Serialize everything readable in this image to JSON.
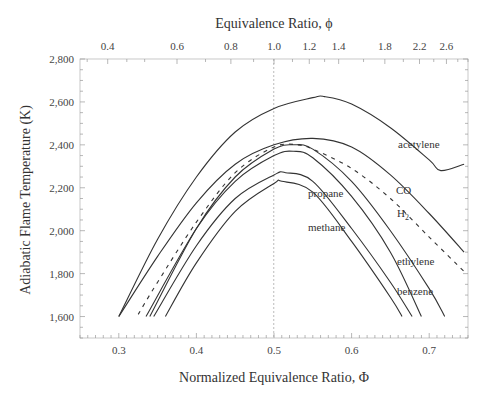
{
  "chart_data": {
    "type": "line",
    "title": "",
    "top_axis": {
      "label": "Equivalence Ratio, ϕ",
      "ticks": [
        "0.4",
        "0.6",
        "0.8",
        "1.0",
        "1.2",
        "1.4",
        "1.8",
        "2.2",
        "2.6"
      ]
    },
    "xlabel": "Normalized Equivalence Ratio, Φ",
    "ylabel": "Adiabatic Flame Temperature (K)",
    "xlim": [
      0.25,
      0.75
    ],
    "ylim": [
      1500,
      2800
    ],
    "x_ticks": [
      "0.3",
      "0.4",
      "0.5",
      "0.6",
      "0.7"
    ],
    "y_ticks": [
      "1,600",
      "1,800",
      "2,000",
      "2,200",
      "2,400",
      "2,600",
      "2,800"
    ],
    "reference_line": {
      "x": 0.5,
      "style": "dotted"
    },
    "grid": false,
    "legend": "inline labels",
    "series": [
      {
        "name": "acetylene",
        "style": "solid",
        "x": [
          0.3,
          0.35,
          0.4,
          0.45,
          0.5,
          0.55,
          0.565,
          0.6,
          0.65,
          0.7,
          0.715,
          0.745
        ],
        "y": [
          1600,
          1960,
          2250,
          2460,
          2570,
          2620,
          2625,
          2590,
          2480,
          2330,
          2280,
          2310
        ]
      },
      {
        "name": "CO",
        "style": "solid",
        "x": [
          0.3,
          0.35,
          0.4,
          0.45,
          0.5,
          0.55,
          0.6,
          0.65,
          0.7,
          0.745
        ],
        "y": [
          1600,
          1880,
          2130,
          2310,
          2400,
          2430,
          2390,
          2260,
          2080,
          1900
        ]
      },
      {
        "name": "H2",
        "style": "dashed",
        "x": [
          0.325,
          0.35,
          0.4,
          0.45,
          0.5,
          0.53,
          0.55,
          0.6,
          0.65,
          0.7,
          0.745
        ],
        "y": [
          1610,
          1760,
          2040,
          2270,
          2390,
          2400,
          2380,
          2290,
          2150,
          1970,
          1810
        ]
      },
      {
        "name": "ethylene",
        "style": "solid",
        "x": [
          0.34,
          0.4,
          0.45,
          0.5,
          0.525,
          0.55,
          0.6,
          0.65,
          0.7,
          0.72
        ],
        "y": [
          1600,
          2010,
          2250,
          2380,
          2400,
          2380,
          2230,
          2000,
          1730,
          1600
        ]
      },
      {
        "name": "benzene",
        "style": "solid",
        "x": [
          0.335,
          0.4,
          0.45,
          0.5,
          0.525,
          0.55,
          0.6,
          0.65,
          0.69
        ],
        "y": [
          1600,
          2010,
          2230,
          2350,
          2370,
          2340,
          2160,
          1900,
          1600
        ]
      },
      {
        "name": "propane",
        "style": "solid",
        "x": [
          0.345,
          0.4,
          0.45,
          0.5,
          0.515,
          0.55,
          0.6,
          0.65,
          0.678
        ],
        "y": [
          1600,
          1930,
          2150,
          2260,
          2270,
          2230,
          2010,
          1760,
          1600
        ]
      },
      {
        "name": "methane",
        "style": "solid",
        "x": [
          0.36,
          0.4,
          0.45,
          0.5,
          0.51,
          0.55,
          0.6,
          0.65,
          0.665
        ],
        "y": [
          1600,
          1850,
          2090,
          2220,
          2230,
          2180,
          1950,
          1690,
          1600
        ]
      }
    ],
    "annotations": [
      "acetylene",
      "CO",
      "H2",
      "propane",
      "methane",
      "ethylene",
      "benzene"
    ]
  },
  "labels": {
    "top_title": "Equivalence Ratio, ϕ",
    "bottom_title": "Normalized Equivalence Ratio, Φ",
    "y_title": "Adiabatic Flame Temperature (K)",
    "acetylene": "acetylene",
    "co": "CO",
    "h2_main": "H",
    "h2_sub": "2",
    "propane": "propane",
    "methane": "methane",
    "ethylene": "ethylene",
    "benzene": "benzene"
  }
}
